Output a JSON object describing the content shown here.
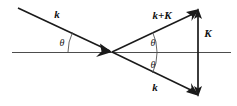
{
  "figure": {
    "type": "vector-diagram",
    "background_color": "#ffffff",
    "stroke_color": "#1a1a1a",
    "axis_color": "#4d4d4d",
    "width": 237,
    "height": 106
  },
  "labels": {
    "k_incident": "k",
    "k_plus_K": "k+K",
    "K_vector": "K",
    "k_scattered": "k",
    "theta_incident": "θ",
    "theta_upper": "θ",
    "theta_lower": "θ"
  },
  "geometry": {
    "origin": {
      "x": 112,
      "y": 52
    },
    "horizontal_axis": {
      "x1": 12,
      "y1": 52,
      "x2": 231,
      "y2": 52
    },
    "vectors": [
      {
        "name": "k-incident",
        "label": "k",
        "from": {
          "x": 18,
          "y": 8
        },
        "to": {
          "x": 112,
          "y": 52
        },
        "arrow_at": "to",
        "angle_deg": 25
      },
      {
        "name": "k-plus-K",
        "label": "k+K",
        "from": {
          "x": 112,
          "y": 52
        },
        "to": {
          "x": 198,
          "y": 10
        },
        "arrow_at": "to",
        "angle_deg": 26
      },
      {
        "name": "k-scattered",
        "label": "k",
        "from": {
          "x": 112,
          "y": 52
        },
        "to": {
          "x": 198,
          "y": 95
        },
        "arrow_at": "to",
        "angle_deg": -26
      },
      {
        "name": "K-reciprocal",
        "label": "K",
        "from": {
          "x": 198,
          "y": 95
        },
        "to": {
          "x": 198,
          "y": 10
        },
        "arrow_at": "both",
        "angle_deg": 90
      }
    ],
    "angle_arcs": [
      {
        "name": "theta-incident",
        "center": {
          "x": 112,
          "y": 52
        },
        "radius": 48,
        "label": "θ"
      },
      {
        "name": "theta-upper",
        "center": {
          "x": 112,
          "y": 52
        },
        "radius": 45,
        "label": "θ"
      },
      {
        "name": "theta-lower",
        "center": {
          "x": 112,
          "y": 52
        },
        "radius": 45,
        "label": "θ"
      }
    ]
  },
  "label_positions": {
    "k_incident": {
      "x": 57,
      "y": 18
    },
    "k_plus_K": {
      "x": 149,
      "y": 19
    },
    "K_vector": {
      "x": 204,
      "y": 36
    },
    "k_scattered": {
      "x": 149,
      "y": 90
    },
    "theta_incident": {
      "x": 59,
      "y": 45
    },
    "theta_upper": {
      "x": 150,
      "y": 45
    },
    "theta_lower": {
      "x": 150,
      "y": 66
    }
  }
}
